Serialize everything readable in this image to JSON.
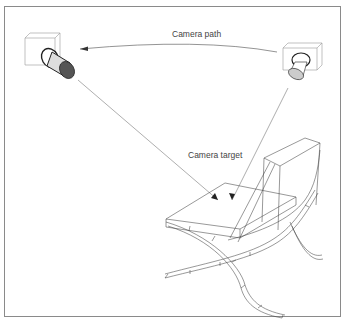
{
  "figure": {
    "labels": {
      "camera_path": "Camera path",
      "camera_target": "Camera target"
    },
    "elements": [
      "start-camera",
      "end-camera",
      "camera-path-arc",
      "sight-lines",
      "chair-wireframe"
    ]
  }
}
